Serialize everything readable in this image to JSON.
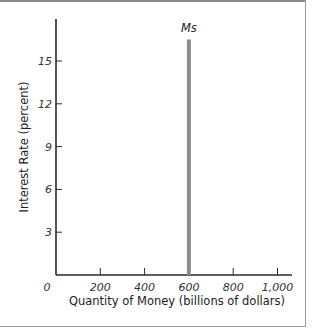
{
  "chart_data": {
    "type": "line",
    "title": "",
    "xlabel": "Quantity of Money (billions of dollars)",
    "ylabel": "Interest Rate (percent)",
    "xlim": [
      0,
      1050
    ],
    "ylim": [
      0,
      18
    ],
    "x_ticks": [
      0,
      200,
      400,
      600,
      800,
      1000
    ],
    "x_tick_labels": [
      "0",
      "200",
      "400",
      "600",
      "800",
      "1,000"
    ],
    "y_ticks": [
      3,
      6,
      9,
      12,
      15
    ],
    "y_tick_labels": [
      "3",
      "6",
      "9",
      "12",
      "15"
    ],
    "grid": false,
    "legend": "none",
    "series": [
      {
        "name": "Ms",
        "label": "Ms",
        "color": "#8c8c8c",
        "points": [
          {
            "x": 600,
            "y": 0
          },
          {
            "x": 600,
            "y": 16.5
          }
        ]
      }
    ],
    "annotations": [
      {
        "text": "Ms",
        "x": 600,
        "y": 17.3
      }
    ]
  },
  "colors": {
    "axis": "#2a2a2a",
    "supply_line": "#8c8c8c",
    "frame": "#9a9a9a"
  }
}
